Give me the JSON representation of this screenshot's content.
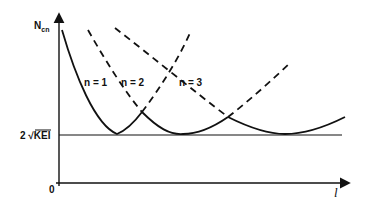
{
  "diagram": {
    "y_axis_label": "N",
    "y_axis_label_sub": "cn",
    "x_axis_label": "l",
    "origin_label": "0",
    "threshold_label_prefix": "2 √",
    "threshold_label_radicand": "KEI",
    "curves": [
      {
        "label": "n = 1",
        "style": "solid-left/dashed-right",
        "minimum_x": 117
      },
      {
        "label": "n = 2",
        "style": "solid-middle/dashed-ends",
        "minimum_x": 183
      },
      {
        "label": "n = 3",
        "style": "solid-right/dashed-left",
        "minimum_x": 285
      }
    ],
    "colors": {
      "ink": "#111111",
      "background": "#ffffff"
    }
  }
}
